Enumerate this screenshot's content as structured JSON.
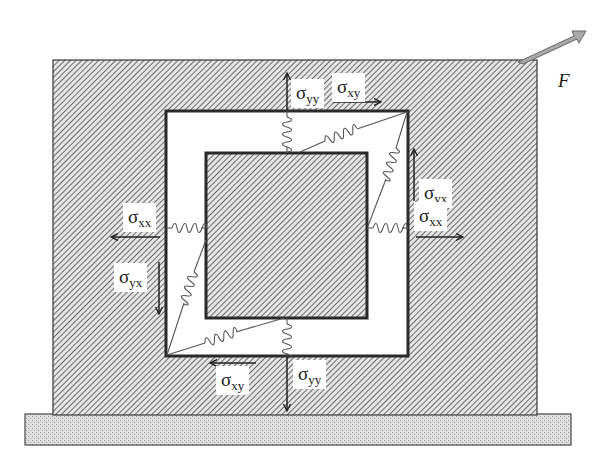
{
  "diagram": {
    "force": {
      "label": "F",
      "direction": "up-right",
      "color": "#a8a8a8"
    },
    "labels": {
      "top_normal": {
        "symbol": "σ",
        "sub": "yy",
        "arrow": "up"
      },
      "top_shear": {
        "symbol": "σ",
        "sub": "xy",
        "arrow": "right"
      },
      "right_shear": {
        "symbol": "σ",
        "sub": "yx",
        "arrow": "up"
      },
      "right_normal": {
        "symbol": "σ",
        "sub": "xx",
        "arrow": "right"
      },
      "left_normal": {
        "symbol": "σ",
        "sub": "xx",
        "arrow": "left"
      },
      "left_shear": {
        "symbol": "σ",
        "sub": "yx",
        "arrow": "down"
      },
      "bottom_shear": {
        "symbol": "σ",
        "sub": "xy",
        "arrow": "left"
      },
      "bottom_normal": {
        "symbol": "σ",
        "sub": "yy",
        "arrow": "down"
      }
    },
    "colors": {
      "hatch_bg": "#d9d9d9",
      "hatch_line": "#555555",
      "border": "#2a2a2a",
      "base_fill": "#d0d0d0",
      "spring": "#555555"
    },
    "parts": [
      "outer-block",
      "white-frame",
      "inner-square",
      "springs",
      "base-plate",
      "force-arrow"
    ]
  }
}
